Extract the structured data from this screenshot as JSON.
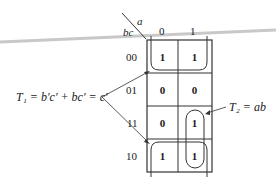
{
  "kmap": {
    "variable_col": "a",
    "variable_row": "bc",
    "col_headers": [
      "0",
      "1"
    ],
    "row_headers": [
      "00",
      "01",
      "11",
      "10"
    ],
    "cells": [
      [
        "1",
        "1"
      ],
      [
        "0",
        "0"
      ],
      [
        "0",
        "1"
      ],
      [
        "1",
        "1"
      ]
    ]
  },
  "groups": {
    "t1": {
      "label": "T₁ = b′c′ + bc′ = c′",
      "cells": "rows 00 and 10 (wrap-around)"
    },
    "t2": {
      "label": "T₂ = ab",
      "cells": "column a=1, rows 11 and 10"
    }
  },
  "colors": {
    "line": "#333333",
    "scan_artifact": "#c8c8c8"
  }
}
